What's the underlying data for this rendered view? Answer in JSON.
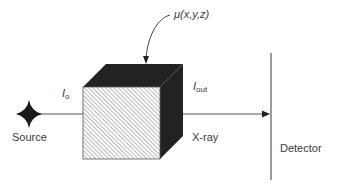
{
  "diagram": {
    "source_label": "Source",
    "xray_label": "X-ray",
    "detector_label": "Detector",
    "i0_label": {
      "main": "I",
      "sub": "o"
    },
    "iout_label": {
      "main": "I",
      "sub": "out"
    },
    "mu_label": "μ(x,y,z)",
    "colors": {
      "cube_dark": "#222222",
      "line": "#555555",
      "hatch": "#777777",
      "text": "#3a3a3a"
    },
    "icons": [
      "star-source-icon",
      "arrow-head-icon"
    ]
  }
}
